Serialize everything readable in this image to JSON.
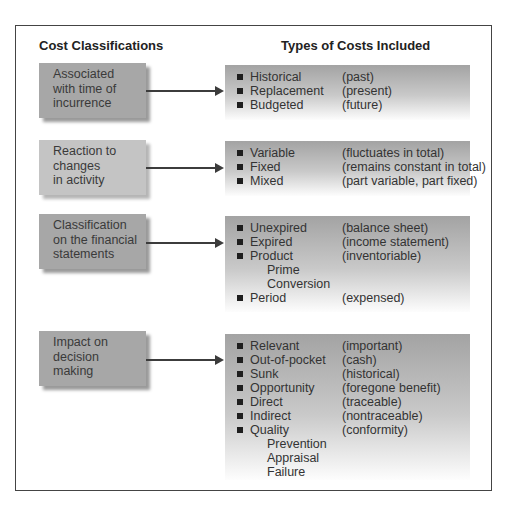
{
  "headings": {
    "left": "Cost Classifications",
    "right": "Types of Costs Included"
  },
  "sections": [
    {
      "classification_lines": [
        "Associated",
        "with time of",
        "incurrence"
      ],
      "box_shade": "#a7a7a7",
      "items": [
        {
          "type": "bullet",
          "term": "Historical",
          "desc": "(past)"
        },
        {
          "type": "bullet",
          "term": "Replacement",
          "desc": "(present)"
        },
        {
          "type": "bullet",
          "term": "Budgeted",
          "desc": "(future)"
        }
      ]
    },
    {
      "classification_lines": [
        "Reaction to",
        "changes",
        "in activity"
      ],
      "box_shade": "#c4c4c4",
      "items": [
        {
          "type": "bullet",
          "term": "Variable",
          "desc": "(fluctuates in total)"
        },
        {
          "type": "bullet",
          "term": "Fixed",
          "desc": "(remains constant in total)"
        },
        {
          "type": "bullet",
          "term": "Mixed",
          "desc": "(part variable, part fixed)"
        }
      ]
    },
    {
      "classification_lines": [
        "Classification",
        "on the financial",
        "statements"
      ],
      "box_shade": "#a7a7a7",
      "items": [
        {
          "type": "bullet",
          "term": "Unexpired",
          "desc": "(balance sheet)"
        },
        {
          "type": "bullet",
          "term": "Expired",
          "desc": "(income statement)"
        },
        {
          "type": "bullet",
          "term": "Product",
          "desc": "(inventoriable)"
        },
        {
          "type": "sub",
          "term": "Prime"
        },
        {
          "type": "sub",
          "term": "Conversion"
        },
        {
          "type": "bullet",
          "term": "Period",
          "desc": "(expensed)"
        }
      ]
    },
    {
      "classification_lines": [
        "Impact on",
        "decision",
        "making"
      ],
      "box_shade": "#a7a7a7",
      "items": [
        {
          "type": "bullet",
          "term": "Relevant",
          "desc": "(important)"
        },
        {
          "type": "bullet",
          "term": "Out-of-pocket",
          "desc": "(cash)"
        },
        {
          "type": "bullet",
          "term": "Sunk",
          "desc": "(historical)"
        },
        {
          "type": "bullet",
          "term": "Opportunity",
          "desc": "(foregone benefit)"
        },
        {
          "type": "bullet",
          "term": "Direct",
          "desc": "(traceable)"
        },
        {
          "type": "bullet",
          "term": "Indirect",
          "desc": "(nontraceable)"
        },
        {
          "type": "bullet",
          "term": "Quality",
          "desc": "(conformity)"
        },
        {
          "type": "sub",
          "term": "Prevention"
        },
        {
          "type": "sub",
          "term": "Appraisal"
        },
        {
          "type": "sub",
          "term": "Failure"
        }
      ]
    }
  ]
}
